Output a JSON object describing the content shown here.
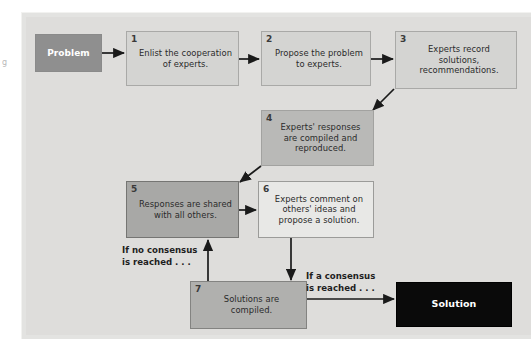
{
  "diagram": {
    "colors": {
      "panel_background": "#dedddb",
      "page_background": "#ffffff",
      "box_light": "#d4d4d2",
      "box_white": "#e8e8e6",
      "box_medium": "#b9b9b7",
      "box_dark": "#a8a8a6",
      "terminal_start": "#8f8f8f",
      "terminal_end": "#0a0a0a",
      "arrow": "#1a1a1a",
      "text": "#2a2a2a",
      "text_inverse": "#ffffff"
    },
    "margin_artifact": "g",
    "nodes": [
      {
        "id": "problem",
        "number": "",
        "label": "Problem",
        "shape": "terminal",
        "fill": "#8f8f8f"
      },
      {
        "id": "step1",
        "number": "1",
        "label": "Enlist the cooperation of experts.",
        "lines": [
          "Enlist the",
          "cooperation",
          "of experts."
        ],
        "shape": "process",
        "fill": "#d4d4d2"
      },
      {
        "id": "step2",
        "number": "2",
        "label": "Propose the problem to experts.",
        "lines": [
          "Propose",
          "the problem to",
          "experts."
        ],
        "shape": "process",
        "fill": "#d4d4d2"
      },
      {
        "id": "step3",
        "number": "3",
        "label": "Experts record solutions, recommendations.",
        "lines": [
          "Experts record",
          "solutions,",
          "recommendations."
        ],
        "shape": "process",
        "fill": "#d4d4d2"
      },
      {
        "id": "step4",
        "number": "4",
        "label": "Experts' responses are compiled and reproduced.",
        "lines": [
          "Experts' responses",
          "are compiled",
          "and reproduced."
        ],
        "shape": "process",
        "fill": "#b9b9b7"
      },
      {
        "id": "step5",
        "number": "5",
        "label": "Responses are shared with all others.",
        "lines": [
          "Responses",
          "are shared with",
          "all others."
        ],
        "shape": "process",
        "fill": "#a8a8a6"
      },
      {
        "id": "step6",
        "number": "6",
        "label": "Experts comment on others' ideas and propose a solution.",
        "lines": [
          "Experts comment",
          "on others' ideas and",
          "propose a solution."
        ],
        "shape": "process",
        "fill": "#e8e8e6"
      },
      {
        "id": "step7",
        "number": "7",
        "label": "Solutions are compiled.",
        "lines": [
          "Solutions",
          "are compiled."
        ],
        "shape": "process",
        "fill": "#b0b0ae"
      },
      {
        "id": "solution",
        "number": "",
        "label": "Solution",
        "shape": "terminal",
        "fill": "#0a0a0a"
      }
    ],
    "edge_labels": {
      "no_consensus_line1": "If no consensus",
      "no_consensus_line2": "is reached . . .",
      "a_consensus_line1": "If a consensus",
      "a_consensus_line2": "is reached . . ."
    },
    "edges": [
      {
        "from": "problem",
        "to": "step1",
        "label": ""
      },
      {
        "from": "step1",
        "to": "step2",
        "label": ""
      },
      {
        "from": "step2",
        "to": "step3",
        "label": ""
      },
      {
        "from": "step3",
        "to": "step4",
        "label": ""
      },
      {
        "from": "step4",
        "to": "step5",
        "label": ""
      },
      {
        "from": "step5",
        "to": "step6",
        "label": ""
      },
      {
        "from": "step6",
        "to": "step7",
        "label": ""
      },
      {
        "from": "step7",
        "to": "step5",
        "label": "If no consensus is reached . . ."
      },
      {
        "from": "step7",
        "to": "solution",
        "label": "If a consensus is reached . . ."
      }
    ]
  }
}
